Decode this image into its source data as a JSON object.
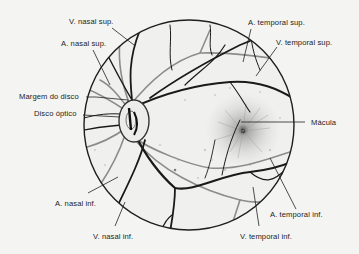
{
  "diagram": {
    "colors": {
      "background": "#f4f4f2",
      "outline": "#1e1e1e",
      "vein": "#1a1a1a",
      "artery": "#8c8c8c",
      "stipple": "#9a9a9a",
      "text": "#1c1c1c"
    },
    "fundus": {
      "cx": 189,
      "cy": 125,
      "r": 105
    },
    "optic_disc": {
      "cx": 132,
      "cy": 121,
      "rx": 15,
      "ry": 21
    },
    "macula": {
      "cx": 243,
      "cy": 131
    },
    "labels": {
      "v_nasal_sup": "V. nasal sup.",
      "a_nasal_sup": "A. nasal sup.",
      "margem_do_disco": "Margem do disco",
      "disco_optico": "Disco óptico",
      "a_temporal_sup": "A. temporal sup.",
      "v_temporal_sup": "V. temporal sup.",
      "macula": "Mácula",
      "a_nasal_inf": "A. nasal inf.",
      "v_nasal_inf": "V. nasal inf.",
      "a_temporal_inf": "A. temporal inf.",
      "v_temporal_inf": "V. temporal inf."
    }
  }
}
